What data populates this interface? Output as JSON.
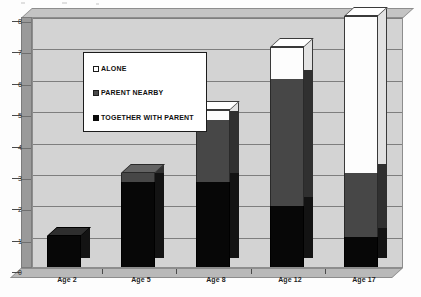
{
  "chart_data": {
    "type": "bar",
    "subtype": "stacked-column-3d",
    "title": "",
    "subtitle": "",
    "xlabel": "",
    "ylabel": "",
    "categories": [
      "Age 2",
      "Age 5",
      "Age 8",
      "Age 12",
      "Age 17"
    ],
    "series": [
      {
        "name": "TOGETHER WITH PARENT",
        "color": "#0a0a0a",
        "values": [
          1.0,
          2.7,
          2.7,
          1.95,
          0.95
        ]
      },
      {
        "name": "PARENT NEARBY",
        "color": "#4a4a4a",
        "values": [
          0.0,
          0.3,
          2.0,
          4.05,
          2.05
        ]
      },
      {
        "name": "ALONE",
        "color": "#ffffff",
        "values": [
          0.0,
          0.0,
          0.3,
          1.0,
          5.0
        ]
      }
    ],
    "totals": [
      1.0,
      3.0,
      5.0,
      7.0,
      8.0
    ],
    "ylim": [
      0,
      8
    ],
    "yticks": [
      0,
      1,
      2,
      3,
      4,
      5,
      6,
      7,
      8
    ],
    "ytick_labels": [
      "0",
      "1",
      "2",
      "3",
      "4",
      "5",
      "6",
      "7",
      "8"
    ],
    "grid": true,
    "legend_position": "upper-left-inside",
    "legend_order": [
      "ALONE",
      "PARENT NEARBY",
      "TOGETHER WITH PARENT"
    ]
  },
  "axis": {
    "y_labels": [
      "8",
      "7",
      "6",
      "5",
      "4",
      "3",
      "2",
      "1",
      "0"
    ],
    "x_labels": [
      "Age 2",
      "Age 5",
      "Age 8",
      "Age 12",
      "Age 17"
    ]
  },
  "legend": {
    "items": [
      {
        "label": "ALONE",
        "swatch": "alone-swatch-icon"
      },
      {
        "label": "PARENT NEARBY",
        "swatch": "parent-nearby-swatch-icon"
      },
      {
        "label": "TOGETHER WITH PARENT",
        "swatch": "together-with-parent-swatch-icon"
      }
    ]
  },
  "colors": {
    "plot_background": "#d3d3d3",
    "gridline": "#7e7e7e",
    "wall": "#9a9a9a",
    "floor": "#b9b9b9",
    "together": "#0a0a0a",
    "nearby": "#4a4a4a",
    "alone": "#ffffff"
  }
}
